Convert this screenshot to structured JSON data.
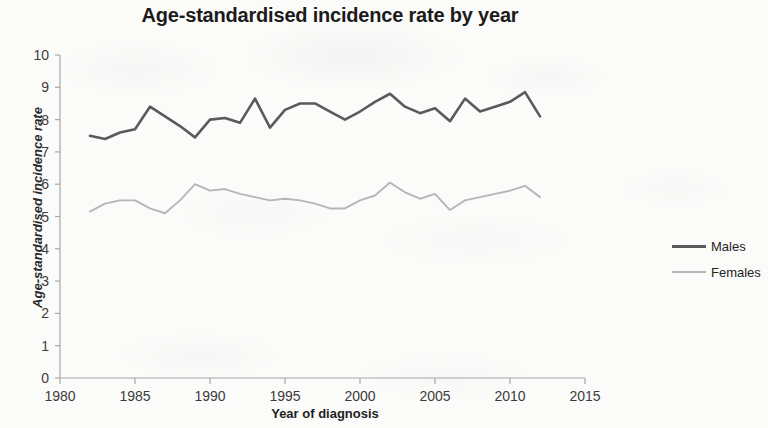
{
  "chart_data": {
    "type": "line",
    "title": "Age-standardised incidence rate by year",
    "xlabel": "Year of diagnosis",
    "ylabel": "Age-standardised incidence rate",
    "xlim": [
      1980,
      2015
    ],
    "ylim": [
      0,
      10
    ],
    "xticks": [
      1980,
      1985,
      1990,
      1995,
      2000,
      2005,
      2010,
      2015
    ],
    "yticks": [
      0,
      1,
      2,
      3,
      4,
      5,
      6,
      7,
      8,
      9,
      10
    ],
    "grid": false,
    "legend_position": "right",
    "x": [
      1982,
      1983,
      1984,
      1985,
      1986,
      1987,
      1988,
      1989,
      1990,
      1991,
      1992,
      1993,
      1994,
      1995,
      1996,
      1997,
      1998,
      1999,
      2000,
      2001,
      2002,
      2003,
      2004,
      2005,
      2006,
      2007,
      2008,
      2009,
      2010,
      2011,
      2012
    ],
    "series": [
      {
        "name": "Males",
        "color": "#5a5a5a",
        "values": [
          7.5,
          7.4,
          7.6,
          7.7,
          8.4,
          8.1,
          7.8,
          7.45,
          8.0,
          8.05,
          7.9,
          8.65,
          7.75,
          8.3,
          8.5,
          8.5,
          8.25,
          8.0,
          8.25,
          8.55,
          8.8,
          8.4,
          8.2,
          8.35,
          7.95,
          8.65,
          8.25,
          8.4,
          8.55,
          8.85,
          8.1
        ]
      },
      {
        "name": "Females",
        "color": "#b6b6b6",
        "values": [
          5.15,
          5.4,
          5.5,
          5.5,
          5.25,
          5.1,
          5.5,
          6.0,
          5.8,
          5.85,
          5.7,
          5.6,
          5.5,
          5.55,
          5.5,
          5.4,
          5.25,
          5.25,
          5.5,
          5.65,
          6.05,
          5.75,
          5.55,
          5.7,
          5.2,
          5.5,
          5.6,
          5.7,
          5.8,
          5.95,
          5.6
        ]
      }
    ]
  },
  "legend": {
    "items": [
      {
        "label": "Males"
      },
      {
        "label": "Females"
      }
    ]
  }
}
